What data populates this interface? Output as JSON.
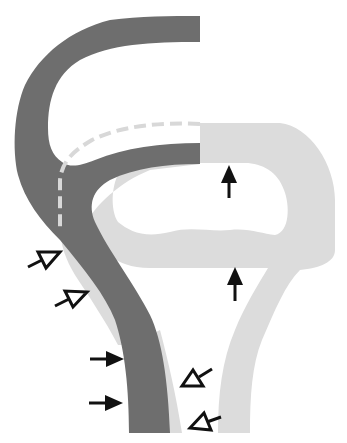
{
  "diagram": {
    "type": "anatomical-schematic",
    "labels": [],
    "colors": {
      "background": "#ffffff",
      "dark_structure": "#6e6e6e",
      "light_structure": "#dcdcdc",
      "dashed_line": "#d8d8d8",
      "arrow": "#111111"
    },
    "arrows": {
      "filled_up": [
        {
          "from": [
            229,
            198
          ],
          "to": [
            229,
            165
          ]
        },
        {
          "from": [
            235,
            301
          ],
          "to": [
            235,
            267
          ]
        }
      ],
      "filled_right": [
        {
          "from": [
            90,
            359
          ],
          "to": [
            124,
            359
          ]
        },
        {
          "from": [
            89,
            403
          ],
          "to": [
            123,
            403
          ]
        }
      ],
      "open_upright": [
        {
          "from": [
            28,
            267
          ],
          "to": [
            60,
            252
          ]
        },
        {
          "from": [
            55,
            306
          ],
          "to": [
            87,
            292
          ]
        }
      ],
      "open_downleft": [
        {
          "from": [
            212,
            369
          ],
          "to": [
            182,
            386
          ]
        },
        {
          "from": [
            221,
            417
          ],
          "to": [
            190,
            428
          ]
        }
      ]
    }
  }
}
